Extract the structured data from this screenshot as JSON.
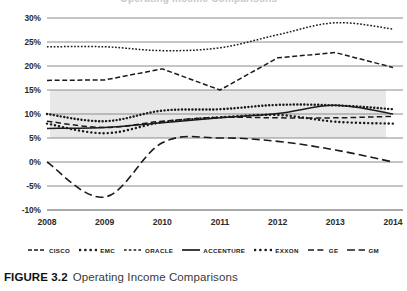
{
  "figure": {
    "caption_label": "FIGURE 3.2",
    "caption_text": "Operating Income Comparisons",
    "clipped_heading": "Operating Income Comparisons"
  },
  "legend": {
    "items": [
      {
        "label": "CISCO",
        "style": "dashed"
      },
      {
        "label": "EMC",
        "style": "dotted-thick"
      },
      {
        "label": "ORACLE",
        "style": "dotted-fine"
      },
      {
        "label": "ACCENTURE",
        "style": "solid"
      },
      {
        "label": "EXXON",
        "style": "dotted-round"
      },
      {
        "label": "GE",
        "style": "dash-medium"
      },
      {
        "label": "GM",
        "style": "dash-long"
      }
    ]
  },
  "colors": {
    "ink": "#1a1a1a",
    "gridline": "#8c8c8c",
    "band": "#e8e8e8",
    "background": "#ffffff"
  },
  "chart_data": {
    "type": "line",
    "title": "Operating Income Comparisons",
    "xlabel": "",
    "ylabel": "",
    "x": [
      2008,
      2009,
      2010,
      2011,
      2012,
      2013,
      2014
    ],
    "categories": [
      "2008",
      "2009",
      "2010",
      "2011",
      "2012",
      "2013",
      "2014"
    ],
    "ylim": [
      -10,
      30
    ],
    "ytick_values": [
      30,
      25,
      20,
      15,
      10,
      5,
      0,
      -5,
      -10
    ],
    "ytick_labels": [
      "30%",
      "25%",
      "20%",
      "15%",
      "10%",
      "5%",
      "0%",
      "-5%",
      "-10%"
    ],
    "grid": true,
    "grid_axis": "y",
    "legend_position": "bottom",
    "unit": "percent",
    "shaded_band": {
      "from": 5,
      "to": 15,
      "color": "#e8e8e8"
    },
    "series": [
      {
        "name": "CISCO",
        "style": "dashed",
        "values": [
          17.0,
          17.1,
          19.4,
          15.0,
          21.7,
          22.8,
          19.7
        ]
      },
      {
        "name": "EMC",
        "style": "dotted-thick",
        "values": [
          10.0,
          8.5,
          10.7,
          11.0,
          11.9,
          11.8,
          11.0
        ]
      },
      {
        "name": "ORACLE",
        "style": "dotted-fine",
        "values": [
          24.0,
          24.0,
          23.2,
          23.8,
          26.5,
          29.0,
          27.7
        ]
      },
      {
        "name": "ACCENTURE",
        "style": "solid",
        "values": [
          7.0,
          7.2,
          8.2,
          9.2,
          10.1,
          11.8,
          10.0
        ]
      },
      {
        "name": "EXXON",
        "style": "dotted-round",
        "values": [
          8.0,
          6.0,
          8.3,
          9.3,
          9.8,
          8.4,
          8.0
        ]
      },
      {
        "name": "GE",
        "style": "dash-medium",
        "values": [
          8.5,
          7.2,
          8.5,
          9.3,
          9.2,
          9.2,
          9.5
        ]
      },
      {
        "name": "GM",
        "style": "dash-long",
        "values": [
          0.0,
          -7.3,
          4.0,
          5.0,
          4.3,
          2.5,
          0.0
        ]
      }
    ]
  }
}
